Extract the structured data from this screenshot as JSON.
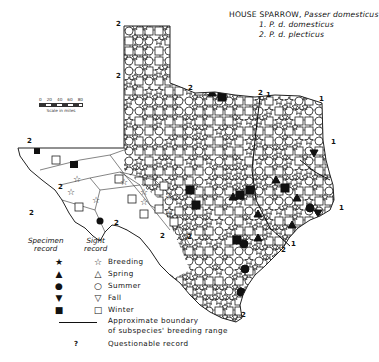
{
  "title": {
    "common_name": "HOUSE SPARROW,",
    "scientific_name": "Passer domesticus",
    "subspecies": [
      "1. P. d. domesticus",
      "2. P. d. plecticus"
    ]
  },
  "scale": {
    "ticks": [
      "0",
      "20",
      "40",
      "60",
      "80"
    ],
    "label": "Scale in miles"
  },
  "legend": {
    "specimen_header_1": "Specimen",
    "specimen_header_2": "record",
    "sight_header_1": "Sight",
    "sight_header_2": "record",
    "entries": [
      {
        "season": "Breeding",
        "specimen_symbol": "★",
        "sight_symbol": "☆"
      },
      {
        "season": "Spring",
        "specimen_symbol": "▲",
        "sight_symbol": "△"
      },
      {
        "season": "Summer",
        "specimen_symbol": "●",
        "sight_symbol": "○"
      },
      {
        "season": "Fall",
        "specimen_symbol": "▼",
        "sight_symbol": "▽"
      },
      {
        "season": "Winter",
        "specimen_symbol": "■",
        "sight_symbol": "□"
      }
    ],
    "boundary_label_1": "Approximate boundary",
    "boundary_label_2": "of subspecies' breeding range",
    "questionable_symbol": "?",
    "questionable_label": "Questionable record"
  },
  "map": {
    "region": "Texas",
    "subspecies_labels": [
      {
        "text": "2",
        "x": 116,
        "y": 26
      },
      {
        "text": "2",
        "x": 116,
        "y": 78
      },
      {
        "text": "2",
        "x": 188,
        "y": 90
      },
      {
        "text": "2",
        "x": 258,
        "y": 95
      },
      {
        "text": "1",
        "x": 266,
        "y": 97
      },
      {
        "text": "1",
        "x": 319,
        "y": 101
      },
      {
        "text": "1",
        "x": 331,
        "y": 144
      },
      {
        "text": "1",
        "x": 339,
        "y": 210
      },
      {
        "text": "1",
        "x": 291,
        "y": 246
      },
      {
        "text": "2",
        "x": 281,
        "y": 252
      },
      {
        "text": "2",
        "x": 29,
        "y": 215
      },
      {
        "text": "2",
        "x": 58,
        "y": 189
      },
      {
        "text": "2",
        "x": 114,
        "y": 225
      },
      {
        "text": "2",
        "x": 187,
        "y": 239
      },
      {
        "text": "2",
        "x": 241,
        "y": 317
      },
      {
        "text": "2",
        "x": 27,
        "y": 143
      },
      {
        "text": "2",
        "x": 160,
        "y": 238
      }
    ]
  }
}
